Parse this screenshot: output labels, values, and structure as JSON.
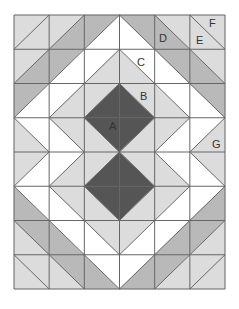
{
  "diagram": {
    "grid": {
      "cols": 6,
      "rows": 8,
      "x": 14,
      "y": 15,
      "width": 211,
      "height": 274
    },
    "colors": {
      "W": "#ffffff",
      "L": "#dcdcdc",
      "M": "#b9b9b9",
      "D": "#555555",
      "line": "#666666"
    },
    "cells": [
      [
        {
          "d": "/",
          "a": "L",
          "b": "L"
        },
        {
          "d": "/",
          "a": "L",
          "b": "M"
        },
        {
          "d": "/",
          "a": "M",
          "b": "W"
        },
        {
          "d": "\\",
          "a": "W",
          "b": "M"
        },
        {
          "d": "\\",
          "a": "M",
          "b": "L"
        },
        {
          "d": "\\",
          "a": "L",
          "b": "L"
        }
      ],
      [
        {
          "d": "/",
          "a": "L",
          "b": "M"
        },
        {
          "d": "/",
          "a": "M",
          "b": "W"
        },
        {
          "d": "/",
          "a": "W",
          "b": "L"
        },
        {
          "d": "\\",
          "a": "L",
          "b": "W"
        },
        {
          "d": "\\",
          "a": "W",
          "b": "M"
        },
        {
          "d": "\\",
          "a": "M",
          "b": "L"
        }
      ],
      [
        {
          "d": "/",
          "a": "M",
          "b": "W"
        },
        {
          "d": "/",
          "a": "W",
          "b": "L"
        },
        {
          "d": "/",
          "a": "L",
          "b": "D"
        },
        {
          "d": "\\",
          "a": "D",
          "b": "L"
        },
        {
          "d": "\\",
          "a": "L",
          "b": "W"
        },
        {
          "d": "\\",
          "a": "W",
          "b": "M"
        }
      ],
      [
        {
          "d": "\\",
          "a": "L",
          "b": "W"
        },
        {
          "d": "\\",
          "a": "W",
          "b": "L"
        },
        {
          "d": "\\",
          "a": "L",
          "b": "D"
        },
        {
          "d": "/",
          "a": "D",
          "b": "L"
        },
        {
          "d": "/",
          "a": "L",
          "b": "W"
        },
        {
          "d": "/",
          "a": "W",
          "b": "L"
        }
      ],
      [
        {
          "d": "/",
          "a": "L",
          "b": "W"
        },
        {
          "d": "/",
          "a": "W",
          "b": "L"
        },
        {
          "d": "/",
          "a": "L",
          "b": "D"
        },
        {
          "d": "\\",
          "a": "D",
          "b": "L"
        },
        {
          "d": "\\",
          "a": "L",
          "b": "W"
        },
        {
          "d": "\\",
          "a": "W",
          "b": "L"
        }
      ],
      [
        {
          "d": "\\",
          "a": "M",
          "b": "W"
        },
        {
          "d": "\\",
          "a": "W",
          "b": "L"
        },
        {
          "d": "\\",
          "a": "L",
          "b": "D"
        },
        {
          "d": "/",
          "a": "D",
          "b": "L"
        },
        {
          "d": "/",
          "a": "L",
          "b": "W"
        },
        {
          "d": "/",
          "a": "W",
          "b": "M"
        }
      ],
      [
        {
          "d": "\\",
          "a": "L",
          "b": "M"
        },
        {
          "d": "\\",
          "a": "M",
          "b": "W"
        },
        {
          "d": "\\",
          "a": "W",
          "b": "L"
        },
        {
          "d": "/",
          "a": "L",
          "b": "W"
        },
        {
          "d": "/",
          "a": "W",
          "b": "M"
        },
        {
          "d": "/",
          "a": "M",
          "b": "L"
        }
      ],
      [
        {
          "d": "\\",
          "a": "L",
          "b": "L"
        },
        {
          "d": "\\",
          "a": "L",
          "b": "M"
        },
        {
          "d": "\\",
          "a": "M",
          "b": "W"
        },
        {
          "d": "/",
          "a": "W",
          "b": "M"
        },
        {
          "d": "/",
          "a": "M",
          "b": "L"
        },
        {
          "d": "/",
          "a": "L",
          "b": "L"
        }
      ]
    ],
    "labels": [
      {
        "text": "A",
        "x": 109,
        "y": 130
      },
      {
        "text": "B",
        "x": 140,
        "y": 100
      },
      {
        "text": "C",
        "x": 137,
        "y": 66
      },
      {
        "text": "D",
        "x": 159,
        "y": 42
      },
      {
        "text": "E",
        "x": 196,
        "y": 44
      },
      {
        "text": "F",
        "x": 209,
        "y": 27
      },
      {
        "text": "G",
        "x": 212,
        "y": 148
      }
    ]
  }
}
